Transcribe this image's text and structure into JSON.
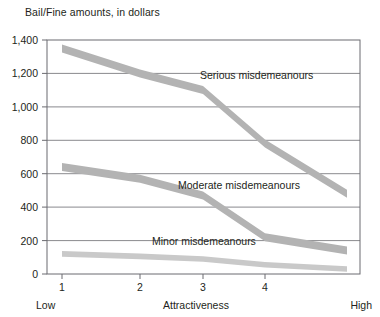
{
  "chart_data": {
    "type": "line",
    "title": "Bail/Fine amounts, in dollars",
    "xlabel": "Attractiveness",
    "ylabel": "",
    "x": [
      1,
      2,
      3,
      4,
      5
    ],
    "xtick_labels": [
      "1",
      "2",
      "3",
      "4",
      ""
    ],
    "x_axis_endpoints": {
      "left": "Low",
      "right": "High"
    },
    "ylim": [
      0,
      1400
    ],
    "ytick_labels": [
      "0",
      "200",
      "400",
      "600",
      "800",
      "1,000",
      "1,200",
      "1,400"
    ],
    "ytick_values": [
      0,
      200,
      400,
      600,
      800,
      1000,
      1200,
      1400
    ],
    "grid": "horizontal",
    "legend_position": "inline-annotations",
    "series": [
      {
        "name": "Serious misdemeanours",
        "values": [
          1350,
          1200,
          1100,
          780,
          480
        ],
        "color": "#b3b3b3"
      },
      {
        "name": "Moderate misdemeanours",
        "values": [
          640,
          570,
          470,
          220,
          140
        ],
        "color": "#b3b3b3"
      },
      {
        "name": "Minor misdemeanours",
        "values": [
          120,
          105,
          90,
          55,
          30
        ],
        "color": "#c9c9c9"
      }
    ],
    "annotations": [
      {
        "text": "Serious misdemeanours",
        "x": 200,
        "y": 75
      },
      {
        "text": "Moderate misdemeanours",
        "x": 178,
        "y": 185
      },
      {
        "text": "Minor misdemeanours",
        "x": 152,
        "y": 241
      }
    ],
    "colors": {
      "band_dark": "#b3b3b3",
      "band_light": "#c9c9c9",
      "frame": "#6b6b70",
      "gridline": "#6b6b70",
      "text": "#231f20"
    }
  }
}
